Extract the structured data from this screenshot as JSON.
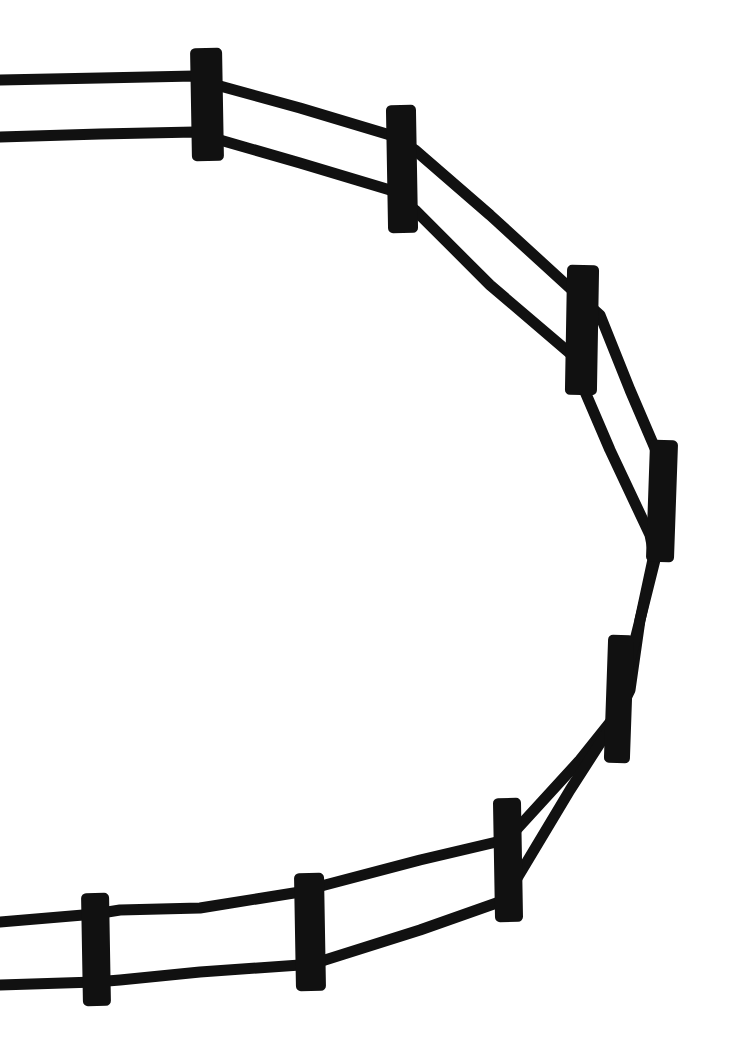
{
  "image": {
    "title": "Fence enclosure line drawing",
    "background": "#ffffff",
    "ink": "#111111",
    "width": 752,
    "height": 1040
  },
  "drawing": {
    "rail_width": 11,
    "rails": {
      "outer": [
        [
          0,
          80
        ],
        [
          100,
          78
        ],
        [
          195,
          76
        ],
        [
          220,
          86
        ],
        [
          300,
          108
        ],
        [
          390,
          135
        ],
        [
          415,
          150
        ],
        [
          490,
          215
        ],
        [
          572,
          290
        ],
        [
          600,
          315
        ],
        [
          630,
          390
        ],
        [
          660,
          460
        ],
        [
          666,
          490
        ],
        [
          655,
          550
        ],
        [
          640,
          620
        ],
        [
          630,
          690
        ],
        [
          620,
          710
        ],
        [
          580,
          760
        ],
        [
          516,
          830
        ],
        [
          505,
          840
        ],
        [
          420,
          860
        ],
        [
          325,
          885
        ],
        [
          300,
          892
        ],
        [
          200,
          908
        ],
        [
          120,
          910
        ],
        [
          95,
          914
        ],
        [
          0,
          922
        ]
      ],
      "inner": [
        [
          0,
          137
        ],
        [
          100,
          134
        ],
        [
          195,
          132
        ],
        [
          220,
          140
        ],
        [
          300,
          163
        ],
        [
          390,
          190
        ],
        [
          415,
          210
        ],
        [
          490,
          285
        ],
        [
          572,
          355
        ],
        [
          580,
          380
        ],
        [
          610,
          450
        ],
        [
          650,
          535
        ],
        [
          655,
          560
        ],
        [
          640,
          620
        ],
        [
          625,
          680
        ],
        [
          615,
          720
        ],
        [
          570,
          790
        ],
        [
          516,
          880
        ],
        [
          505,
          900
        ],
        [
          420,
          930
        ],
        [
          325,
          960
        ],
        [
          300,
          965
        ],
        [
          200,
          972
        ],
        [
          120,
          980
        ],
        [
          95,
          982
        ],
        [
          0,
          985
        ]
      ]
    },
    "posts": [
      {
        "id": "post-1",
        "x": 191,
        "y": 48,
        "w": 32,
        "h": 113,
        "r": -1
      },
      {
        "id": "post-2",
        "x": 387,
        "y": 105,
        "w": 30,
        "h": 128,
        "r": -1
      },
      {
        "id": "post-3",
        "x": 566,
        "y": 265,
        "w": 32,
        "h": 130,
        "r": 1
      },
      {
        "id": "post-4",
        "x": 648,
        "y": 440,
        "w": 28,
        "h": 122,
        "r": 2
      },
      {
        "id": "post-5",
        "x": 606,
        "y": 635,
        "w": 26,
        "h": 128,
        "r": 2
      },
      {
        "id": "post-6",
        "x": 494,
        "y": 798,
        "w": 28,
        "h": 124,
        "r": -1
      },
      {
        "id": "post-7",
        "x": 295,
        "y": 873,
        "w": 30,
        "h": 118,
        "r": -1
      },
      {
        "id": "post-8",
        "x": 82,
        "y": 893,
        "w": 28,
        "h": 113,
        "r": -1
      }
    ]
  }
}
